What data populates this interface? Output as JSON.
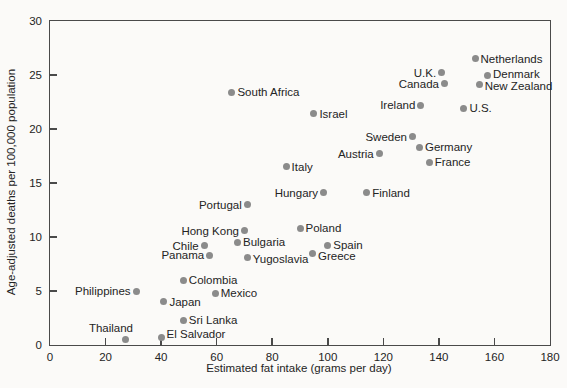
{
  "colors": {
    "background": "#fbfaf8",
    "axis": "#4a4a4a",
    "text": "#242424",
    "point": "#8b8b8b"
  },
  "chart_data": {
    "type": "scatter",
    "title": "",
    "xlabel": "Estimated fat intake (grams per day)",
    "ylabel": "Age-adjusted deaths per 100,000 population",
    "xlim": [
      0,
      180
    ],
    "ylim": [
      0,
      30
    ],
    "x_ticks": [
      0,
      20,
      40,
      60,
      80,
      100,
      120,
      140,
      160,
      180
    ],
    "y_ticks": [
      0,
      5,
      10,
      15,
      20,
      25,
      30
    ],
    "grid": false,
    "legend": false,
    "marker": "circle-gray",
    "points": [
      {
        "name": "Thailand",
        "x": 27,
        "y": 0.5,
        "label_side": "above-left",
        "label_dy": 0
      },
      {
        "name": "El Salvador",
        "x": 40,
        "y": 0.7,
        "label_side": "right",
        "label_dy": -3
      },
      {
        "name": "Sri Lanka",
        "x": 48,
        "y": 2.3,
        "label_side": "right",
        "label_dy": 0
      },
      {
        "name": "Japan",
        "x": 41,
        "y": 4.0,
        "label_side": "right",
        "label_dy": 0
      },
      {
        "name": "Mexico",
        "x": 59.5,
        "y": 4.8,
        "label_side": "right",
        "label_dy": 0
      },
      {
        "name": "Philippines",
        "x": 31,
        "y": 5.0,
        "label_side": "left",
        "label_dy": 0
      },
      {
        "name": "Colombia",
        "x": 48,
        "y": 6.0,
        "label_side": "right",
        "label_dy": 0
      },
      {
        "name": "Yugoslavia",
        "x": 71,
        "y": 8.1,
        "label_side": "right",
        "label_dy": 1
      },
      {
        "name": "Panama",
        "x": 57.5,
        "y": 8.3,
        "label_side": "left",
        "label_dy": 0
      },
      {
        "name": "Greece",
        "x": 94.5,
        "y": 8.5,
        "label_side": "right",
        "label_dy": 3
      },
      {
        "name": "Spain",
        "x": 100,
        "y": 9.2,
        "label_side": "right",
        "label_dy": -1
      },
      {
        "name": "Chile",
        "x": 55.5,
        "y": 9.2,
        "label_side": "left",
        "label_dy": 0
      },
      {
        "name": "Bulgaria",
        "x": 67.5,
        "y": 9.5,
        "label_side": "right",
        "label_dy": 0
      },
      {
        "name": "Hong Kong",
        "x": 70,
        "y": 10.6,
        "label_side": "left",
        "label_dy": 0
      },
      {
        "name": "Poland",
        "x": 90,
        "y": 10.8,
        "label_side": "right",
        "label_dy": 0
      },
      {
        "name": "Portugal",
        "x": 71,
        "y": 13.0,
        "label_side": "left",
        "label_dy": 0
      },
      {
        "name": "Finland",
        "x": 114,
        "y": 14.1,
        "label_side": "right",
        "label_dy": 0
      },
      {
        "name": "Hungary",
        "x": 98.5,
        "y": 14.1,
        "label_side": "left",
        "label_dy": 0
      },
      {
        "name": "Italy",
        "x": 85,
        "y": 16.5,
        "label_side": "right",
        "label_dy": 0
      },
      {
        "name": "France",
        "x": 136.5,
        "y": 16.9,
        "label_side": "right",
        "label_dy": 0
      },
      {
        "name": "Austria",
        "x": 118.5,
        "y": 17.7,
        "label_side": "left",
        "label_dy": 0
      },
      {
        "name": "Germany",
        "x": 133,
        "y": 18.3,
        "label_side": "right",
        "label_dy": 0
      },
      {
        "name": "Sweden",
        "x": 130.5,
        "y": 19.3,
        "label_side": "left",
        "label_dy": 0
      },
      {
        "name": "Israel",
        "x": 95,
        "y": 21.4,
        "label_side": "right",
        "label_dy": 0
      },
      {
        "name": "U.S.",
        "x": 149,
        "y": 21.9,
        "label_side": "right",
        "label_dy": 0
      },
      {
        "name": "Ireland",
        "x": 133.5,
        "y": 22.2,
        "label_side": "left",
        "label_dy": 0
      },
      {
        "name": "South Africa",
        "x": 65.5,
        "y": 23.4,
        "label_side": "right",
        "label_dy": 0
      },
      {
        "name": "New Zealand",
        "x": 154.5,
        "y": 24.1,
        "label_side": "right",
        "label_dy": 1
      },
      {
        "name": "Canada",
        "x": 142,
        "y": 24.2,
        "label_side": "left",
        "label_dy": 0
      },
      {
        "name": "Denmark",
        "x": 157.5,
        "y": 25.0,
        "label_side": "right",
        "label_dy": -1
      },
      {
        "name": "U.K.",
        "x": 141,
        "y": 25.2,
        "label_side": "left",
        "label_dy": 0
      },
      {
        "name": "Netherlands",
        "x": 153,
        "y": 26.5,
        "label_side": "right",
        "label_dy": 0
      }
    ]
  }
}
